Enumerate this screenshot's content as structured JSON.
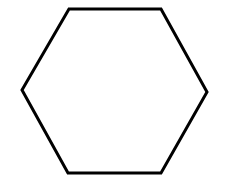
{
  "diagram": {
    "shape": "hexagon",
    "stroke_color": "#000000",
    "fill_color": "#ffffff",
    "background": "#ffffff",
    "stroke_width": 3,
    "vertices": [
      [
        69,
        9
      ],
      [
        161,
        9
      ],
      [
        207,
        92
      ],
      [
        161,
        173
      ],
      [
        68,
        173
      ],
      [
        22,
        90
      ]
    ]
  }
}
